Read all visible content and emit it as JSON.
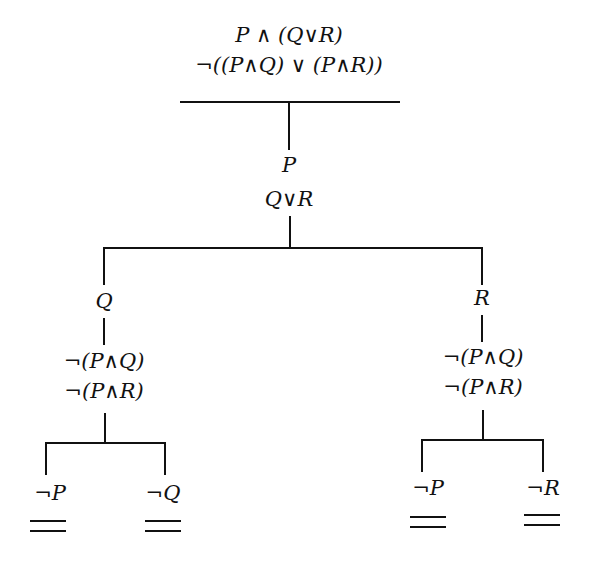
{
  "diagram": {
    "type": "truth-tree",
    "root": {
      "formulas": [
        "P ∧ (Q∨R)",
        "¬((P∧Q) ∨ (P∧R))"
      ]
    },
    "trunk": {
      "formulas": [
        "P",
        "Q∨R"
      ]
    },
    "branches": [
      {
        "id": "left",
        "formulas": [
          "Q"
        ],
        "continued": [
          "¬(P∧Q)",
          "¬(P∧R)"
        ],
        "leaves": [
          {
            "formula": "¬P",
            "closed": true,
            "closure_mark": "="
          },
          {
            "formula": "¬Q",
            "closed": true,
            "closure_mark": "="
          }
        ]
      },
      {
        "id": "right",
        "formulas": [
          "R"
        ],
        "continued": [
          "¬(P∧Q)",
          "¬(P∧R)"
        ],
        "leaves": [
          {
            "formula": "¬P",
            "closed": true,
            "closure_mark": "="
          },
          {
            "formula": "¬R",
            "closed": true,
            "closure_mark": "="
          }
        ]
      }
    ],
    "colors": {
      "ink": "#111111",
      "background": "#ffffff"
    }
  }
}
